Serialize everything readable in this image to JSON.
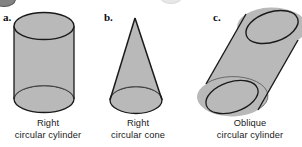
{
  "figure": {
    "background_color": "#ffffff",
    "solid_fill_color": "#b9b9b9",
    "outline_color": "#1a1a1a",
    "items": [
      {
        "letter": "a.",
        "shape_name": "right-circular-cylinder",
        "caption_line1": "Right",
        "caption_line2": "circular cylinder"
      },
      {
        "letter": "b.",
        "shape_name": "right-circular-cone",
        "caption_line1": "Right",
        "caption_line2": "circular cone"
      },
      {
        "letter": "c.",
        "shape_name": "oblique-circular-cylinder",
        "caption_line1": "Oblique",
        "caption_line2": "circular cylinder"
      }
    ]
  },
  "geometry": {
    "cylinder": {
      "cx": 44,
      "top_cy": 26,
      "bottom_cy": 99,
      "rx": 30,
      "ry": 13.5
    },
    "cone": {
      "apex_x": 135,
      "apex_y": 18,
      "base_cx": 136,
      "base_cy": 100,
      "base_rx": 26,
      "base_ry": 13.5
    },
    "oblique_cylinder": {
      "top_cx": 272,
      "top_cy": 27,
      "bottom_cx": 232,
      "bottom_cy": 97,
      "rx": 27,
      "ry": 15,
      "rotation_deg": -18
    }
  }
}
